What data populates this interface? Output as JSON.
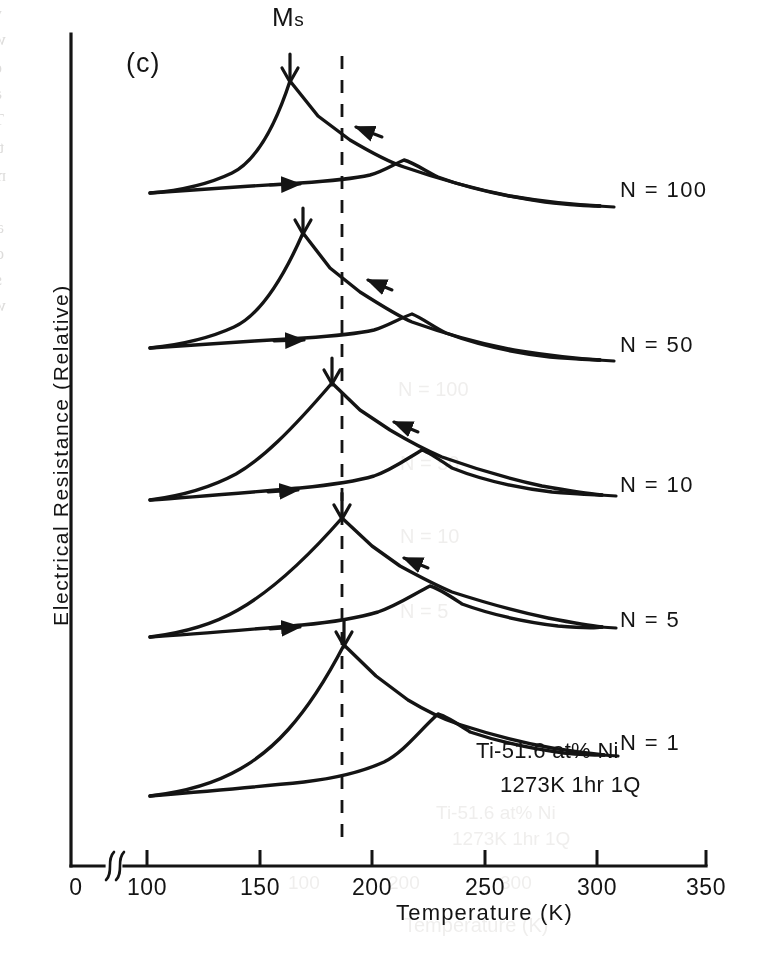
{
  "figure": {
    "panel_label": "(c)",
    "ms_marker_label": "Ms",
    "ms_marker_symbol": "M",
    "ms_marker_subscript": "s",
    "sample_annotation_line1": "Ti-51.6 at% Ni",
    "sample_annotation_line2": "1273K 1hr 1Q",
    "ink_color": "#141414",
    "paper_color": "#ffffff"
  },
  "axes": {
    "x_title": "Temperature (K)",
    "y_title": "Electrical Resistance (Relative)",
    "x_ticks": [
      "0",
      "100",
      "150",
      "200",
      "250",
      "300",
      "350"
    ],
    "x_tick_values": [
      0,
      100,
      150,
      200,
      250,
      300,
      350
    ],
    "has_axis_break": true,
    "axis_break_between": [
      0,
      100
    ],
    "y_ticks": [],
    "y_tick_labels_shown": false,
    "grid": false
  },
  "curves": [
    {
      "label": "N = 100",
      "cycles": 100,
      "ms_temperature": 163,
      "as_peak_temperature": 213,
      "label_x": 620,
      "label_y": 192,
      "lead_x1": 586,
      "lead_x2": 612,
      "lead_y": 199
    },
    {
      "label": "N = 50",
      "cycles": 50,
      "ms_temperature": 168,
      "as_peak_temperature": 215,
      "label_x": 620,
      "label_y": 347,
      "lead_x1": 586,
      "lead_x2": 612,
      "lead_y": 354
    },
    {
      "label": "N = 10",
      "cycles": 10,
      "ms_temperature": 182,
      "as_peak_temperature": 219,
      "label_x": 620,
      "label_y": 487,
      "lead_x1": 586,
      "lead_x2": 612,
      "lead_y": 494
    },
    {
      "label": "N = 5",
      "cycles": 5,
      "ms_temperature": 187,
      "as_peak_temperature": 221,
      "label_x": 620,
      "label_y": 622,
      "lead_x1": 586,
      "lead_x2": 612,
      "lead_y": 629
    },
    {
      "label": "N = 1",
      "cycles": 1,
      "ms_temperature": 188,
      "as_peak_temperature": 224,
      "label_x": 620,
      "label_y": 745,
      "lead_x1": 586,
      "lead_x2": 612,
      "lead_y": 752
    }
  ],
  "reference_line": {
    "type": "vertical-dashed",
    "temperature": 187
  },
  "chart_data": {
    "type": "line",
    "subtitle": "Ti-51.6 at% Ni, 1273K 1hr 1Q",
    "xlabel": "Temperature (K)",
    "ylabel": "Electrical Resistance (Relative)",
    "xlim": [
      100,
      310
    ],
    "xticks": [
      0,
      100,
      150,
      200,
      250,
      300,
      350
    ],
    "axis_break": "between 0 and 100 on the x-axis",
    "ylim_note": "relative units, no numeric y ticks; curves vertically offset per cycle number",
    "grid": false,
    "legend": "inline labels at right end of each curve",
    "annotations": [
      {
        "text": "Ms",
        "type": "arrow-down",
        "note": "marks the martensite start peak of each cooling branch"
      },
      {
        "text": "vertical dashed reference line at 187 K",
        "type": "reference-line"
      },
      {
        "text": "Ti-51.6 at% Ni",
        "type": "sample-composition"
      },
      {
        "text": "1273K 1hr 1Q",
        "type": "heat-treatment"
      }
    ],
    "series": [
      {
        "name": "N = 100",
        "cycles": 100,
        "baseline_offset": 0,
        "ms_temperature": 163,
        "as_peak_temperature": 213,
        "cooling_branch": {
          "x": [
            101,
            115,
            130,
            145,
            155,
            163,
            172,
            185,
            200,
            213,
            230,
            250,
            270,
            290,
            305
          ],
          "y": [
            0.02,
            0.1,
            0.3,
            0.72,
            0.92,
            1.0,
            0.93,
            0.8,
            0.68,
            0.57,
            0.44,
            0.31,
            0.23,
            0.18,
            0.16
          ]
        },
        "heating_branch": {
          "x": [
            101,
            120,
            140,
            160,
            180,
            193,
            200,
            206,
            213,
            222,
            235,
            255,
            275,
            295,
            305
          ],
          "y": [
            0.02,
            0.06,
            0.09,
            0.11,
            0.12,
            0.13,
            0.18,
            0.36,
            0.57,
            0.5,
            0.41,
            0.3,
            0.22,
            0.17,
            0.16
          ]
        }
      },
      {
        "name": "N = 50",
        "cycles": 50,
        "baseline_offset": 0,
        "ms_temperature": 168,
        "as_peak_temperature": 215,
        "cooling_branch": {
          "x": [
            101,
            118,
            134,
            150,
            160,
            168,
            178,
            190,
            204,
            215,
            232,
            252,
            272,
            292,
            305
          ],
          "y": [
            0.02,
            0.11,
            0.33,
            0.74,
            0.93,
            1.0,
            0.92,
            0.79,
            0.66,
            0.55,
            0.42,
            0.3,
            0.22,
            0.17,
            0.15
          ]
        },
        "heating_branch": {
          "x": [
            101,
            122,
            142,
            162,
            182,
            196,
            203,
            209,
            215,
            224,
            238,
            258,
            278,
            297,
            305
          ],
          "y": [
            0.02,
            0.06,
            0.09,
            0.11,
            0.13,
            0.14,
            0.19,
            0.37,
            0.55,
            0.48,
            0.39,
            0.28,
            0.21,
            0.16,
            0.15
          ]
        }
      },
      {
        "name": "N = 10",
        "cycles": 10,
        "baseline_offset": 0,
        "ms_temperature": 182,
        "as_peak_temperature": 219,
        "cooling_branch": {
          "x": [
            101,
            120,
            138,
            155,
            170,
            182,
            192,
            203,
            212,
            219,
            234,
            254,
            274,
            294,
            305
          ],
          "y": [
            0.03,
            0.12,
            0.3,
            0.58,
            0.85,
            1.0,
            0.89,
            0.73,
            0.6,
            0.52,
            0.4,
            0.28,
            0.2,
            0.16,
            0.14
          ]
        },
        "heating_branch": {
          "x": [
            101,
            125,
            145,
            165,
            185,
            200,
            208,
            213,
            219,
            228,
            242,
            262,
            282,
            300,
            305
          ],
          "y": [
            0.03,
            0.06,
            0.08,
            0.1,
            0.12,
            0.15,
            0.24,
            0.4,
            0.52,
            0.46,
            0.37,
            0.27,
            0.2,
            0.15,
            0.14
          ]
        }
      },
      {
        "name": "N = 5",
        "cycles": 5,
        "baseline_offset": 0,
        "ms_temperature": 187,
        "as_peak_temperature": 221,
        "cooling_branch": {
          "x": [
            101,
            122,
            140,
            158,
            173,
            187,
            196,
            206,
            214,
            221,
            236,
            256,
            276,
            295,
            305
          ],
          "y": [
            0.03,
            0.12,
            0.29,
            0.55,
            0.82,
            1.0,
            0.88,
            0.72,
            0.59,
            0.51,
            0.39,
            0.27,
            0.2,
            0.15,
            0.14
          ]
        },
        "heating_branch": {
          "x": [
            101,
            126,
            146,
            166,
            186,
            202,
            210,
            215,
            221,
            230,
            244,
            264,
            284,
            300,
            305
          ],
          "y": [
            0.03,
            0.06,
            0.08,
            0.1,
            0.12,
            0.15,
            0.25,
            0.4,
            0.51,
            0.45,
            0.36,
            0.26,
            0.19,
            0.15,
            0.14
          ]
        }
      },
      {
        "name": "N = 1",
        "cycles": 1,
        "baseline_offset": 0,
        "ms_temperature": 188,
        "as_peak_temperature": 224,
        "cooling_branch": {
          "x": [
            101,
            124,
            142,
            160,
            175,
            188,
            198,
            208,
            217,
            224,
            239,
            258,
            278,
            297,
            305
          ],
          "y": [
            0.03,
            0.11,
            0.27,
            0.53,
            0.8,
            1.0,
            0.87,
            0.71,
            0.58,
            0.5,
            0.38,
            0.27,
            0.19,
            0.15,
            0.13
          ]
        },
        "heating_branch": {
          "x": [
            101,
            128,
            148,
            168,
            188,
            204,
            212,
            218,
            224,
            233,
            247,
            266,
            286,
            301,
            305
          ],
          "y": [
            0.03,
            0.06,
            0.08,
            0.1,
            0.12,
            0.15,
            0.26,
            0.41,
            0.5,
            0.44,
            0.35,
            0.26,
            0.19,
            0.14,
            0.13
          ]
        }
      }
    ]
  },
  "bleed_through": {
    "note": "faint mirrored text from the reverse side of the scanned page",
    "lines": [
      {
        "text": "were introduced by thermal cycling and the density of the dislo",
        "x": 2,
        "y": 4,
        "size": 17
      },
      {
        "text": "with increasing number of cycling [80].",
        "x": 6,
        "y": 30,
        "size": 17
      },
      {
        "text": "ed of thermal cycling effects can be suppressed by introducing",
        "x": 2,
        "y": 58,
        "size": 17
      },
      {
        "text": "and/or a high density of dislocations. Figure 27 shows the effect of",
        "x": 2,
        "y": 84,
        "size": 17
      },
      {
        "text": "Ti-51.6at%Ni alloy which was subjected to a cold rolling",
        "x": 4,
        "y": 110,
        "size": 17
      },
      {
        "text": "thermal heat treatment. No significant change is observed in th",
        "x": 4,
        "y": 138,
        "size": 17
      },
      {
        "text": "most alloys.",
        "x": 6,
        "y": 166,
        "size": 17
      },
      {
        "text": "annealed at a higher temperature (273K). In martensitic",
        "x": 4,
        "y": 218,
        "size": 17
      },
      {
        "text": "due thermal cycling effects are restricted to more stable",
        "x": 4,
        "y": 244,
        "size": 17
      },
      {
        "text": "stress-induced transformation boundaries are released by a specimen",
        "x": 2,
        "y": 270,
        "size": 17
      },
      {
        "text": "which is lower.",
        "x": 6,
        "y": 296,
        "size": 17
      }
    ],
    "ghosts": [
      {
        "text": "N = 100",
        "x": 398,
        "y": 378,
        "size": 20
      },
      {
        "text": "N = 50",
        "x": 400,
        "y": 452,
        "size": 20
      },
      {
        "text": "N = 10",
        "x": 400,
        "y": 525,
        "size": 20
      },
      {
        "text": "N = 5",
        "x": 400,
        "y": 600,
        "size": 20
      },
      {
        "text": "Ti-51.6 at% Ni",
        "x": 436,
        "y": 802,
        "size": 19
      },
      {
        "text": "1273K 1hr 1Q",
        "x": 452,
        "y": 828,
        "size": 19
      },
      {
        "text": "Temperature (K)",
        "x": 404,
        "y": 914,
        "size": 20
      },
      {
        "text": "100",
        "x": 288,
        "y": 872,
        "size": 19
      },
      {
        "text": "200",
        "x": 388,
        "y": 872,
        "size": 19
      },
      {
        "text": "300",
        "x": 500,
        "y": 872,
        "size": 19
      }
    ]
  }
}
